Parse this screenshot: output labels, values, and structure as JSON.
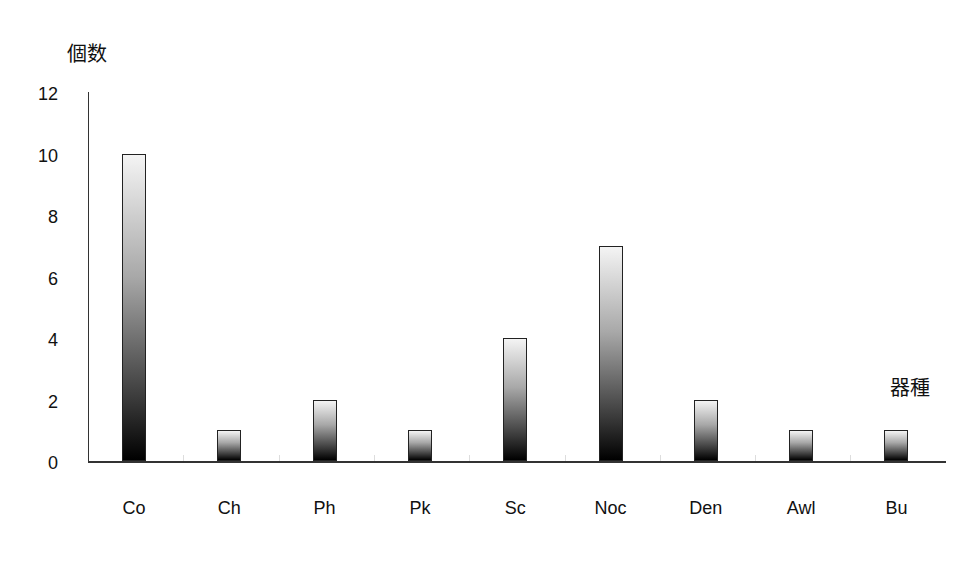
{
  "chart_data": {
    "type": "bar",
    "title": "",
    "xlabel": "器種",
    "ylabel": "個数",
    "categories": [
      "Co",
      "Ch",
      "Ph",
      "Pk",
      "Sc",
      "Noc",
      "Den",
      "Awl",
      "Bu"
    ],
    "values": [
      10,
      1,
      2,
      1,
      4,
      7,
      2,
      1,
      1
    ],
    "ylim": [
      0,
      12
    ],
    "yticks": [
      "0",
      "2",
      "4",
      "6",
      "8",
      "10",
      "12"
    ],
    "grid": false,
    "legend": null
  }
}
